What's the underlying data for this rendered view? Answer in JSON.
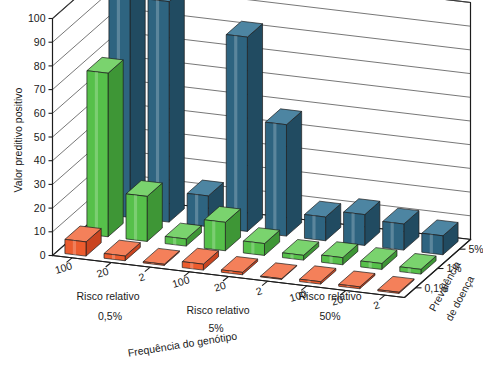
{
  "chart_data": {
    "type": "bar",
    "title": "",
    "subtitle": "",
    "ylabel": "Valor preditivo positivo",
    "xlabel": "Frequência do genótipo",
    "zlabel": "Prevalência de doença",
    "group_axis_label": "Risco relativo",
    "ylim": [
      0,
      100
    ],
    "yticks": [
      0,
      10,
      20,
      30,
      40,
      50,
      60,
      70,
      80,
      90,
      100
    ],
    "grid": true,
    "legend_position": "right-depth-axis",
    "genotype_frequencies": [
      "0,5%",
      "5%",
      "50%"
    ],
    "relative_risks": [
      "100",
      "20",
      "2"
    ],
    "prevalences": [
      "5%",
      "1%",
      "0,1%"
    ],
    "series": [
      {
        "name": "5%",
        "color": "#2e6480",
        "values": [
          [
            100,
            93,
            13
          ],
          [
            82,
            47,
            10
          ],
          [
            13,
            11,
            8
          ]
        ]
      },
      {
        "name": "1%",
        "color": "#56c04a",
        "values": [
          [
            69,
            19,
            3
          ],
          [
            12,
            5,
            2
          ],
          [
            3,
            2.5,
            2
          ]
        ]
      },
      {
        "name": "0,1%",
        "color": "#ec5c2e",
        "values": [
          [
            6,
            2,
            0.5
          ],
          [
            2.5,
            1,
            0.3
          ],
          [
            1,
            0.8,
            0.5
          ]
        ]
      }
    ]
  },
  "axes": {
    "y_title": "Valor preditivo positivo",
    "y_ticks": [
      "0",
      "10",
      "20",
      "30",
      "40",
      "50",
      "60",
      "70",
      "80",
      "90",
      "100"
    ],
    "x_title": "Frequência do genótipo",
    "x_group_title": "Risco relativo",
    "x_group_ticks": [
      "100",
      "20",
      "2"
    ],
    "x_freq_labels": [
      "0,5%",
      "5%",
      "50%"
    ],
    "z_title_line1": "Prevalência",
    "z_title_line2": "de doença",
    "z_ticks": [
      "5%",
      "1%",
      "0,1%"
    ]
  },
  "colors": {
    "blue": "#2e6480",
    "blue_side": "#214b61",
    "blue_top": "#4d85a2",
    "green": "#56c04a",
    "green_side": "#3e9636",
    "green_top": "#7ad36e",
    "orange": "#ec5c2e",
    "orange_side": "#c94420",
    "orange_top": "#f4805a",
    "line": "#1d1d1d",
    "grid": "#4a4a4a"
  }
}
